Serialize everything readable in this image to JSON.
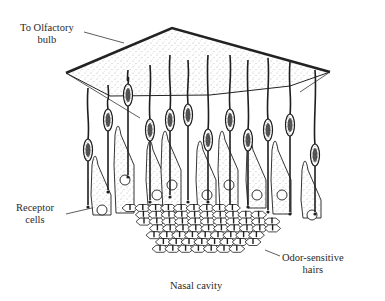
{
  "figure": {
    "labels": {
      "olfactory_bulb": [
        "To Olfactory",
        "bulb"
      ],
      "receptor_cells": [
        "Receptor",
        "cells"
      ],
      "odor_hairs": [
        "Odor-sensitive",
        "hairs"
      ],
      "nasal_cavity": "Nasal cavity"
    },
    "colors": {
      "ink": "#1e1e1e",
      "label_text": "#2a2a2a",
      "stipple": "#6a6a6a",
      "background": "#ffffff"
    }
  }
}
